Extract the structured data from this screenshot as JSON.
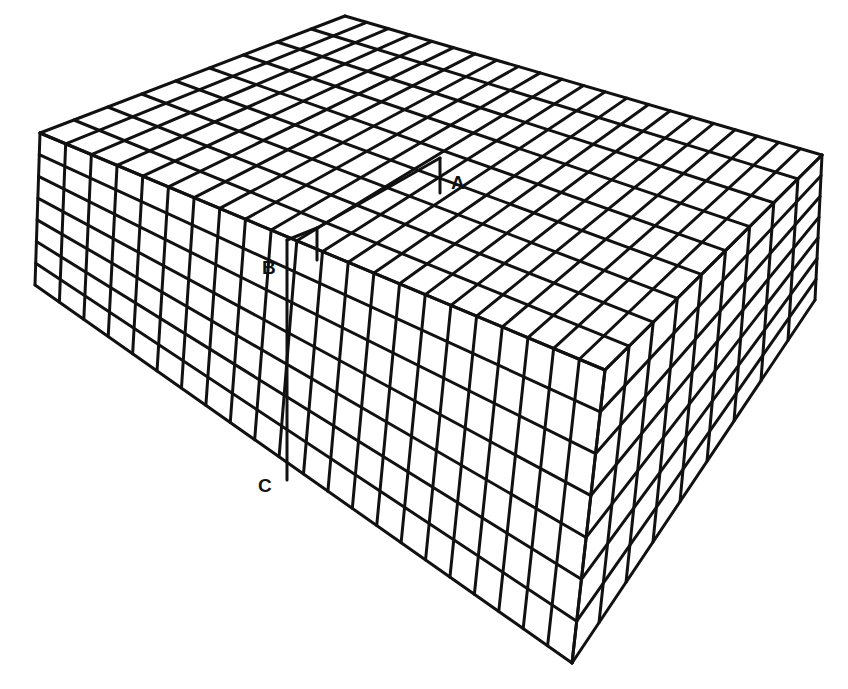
{
  "diagram": {
    "line_color": "#111111",
    "background": "#ffffff",
    "labels": [
      {
        "id": "A",
        "text": "A",
        "x": 457,
        "y": 172
      },
      {
        "id": "B",
        "text": "B",
        "x": 264,
        "y": 258
      },
      {
        "id": "C",
        "text": "C",
        "x": 260,
        "y": 476
      }
    ],
    "block": {
      "top_back": [
        345,
        16
      ],
      "top_left": [
        40,
        133
      ],
      "top_right": [
        822,
        155
      ],
      "top_front": [
        605,
        370
      ],
      "bottom_left": [
        35,
        285
      ],
      "bottom_right": [
        815,
        300
      ],
      "bottom_front": [
        572,
        663
      ],
      "cells_left_to_front": 22,
      "cells_front_to_right": 9,
      "layers": 4
    },
    "step": {
      "description": "Raised half-plane left of dislocation line, step from B down to A",
      "B": [
        287,
        240
      ],
      "A": [
        440,
        193
      ],
      "C": [
        287,
        480
      ]
    }
  }
}
